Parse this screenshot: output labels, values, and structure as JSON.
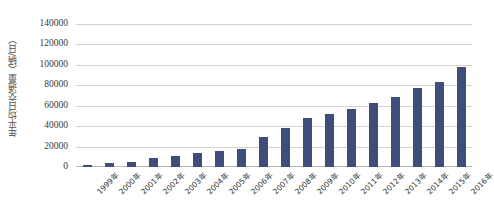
{
  "chart_data": {
    "type": "bar",
    "title": "",
    "subtitle": "",
    "xlabel": "",
    "ylabel": "年平均日交通量（辆/日）",
    "categories": [
      "1999年",
      "2000年",
      "2001年",
      "2002年",
      "2003年",
      "2004年",
      "2005年",
      "2006年",
      "2007年",
      "2008年",
      "2009年",
      "2010年",
      "2011年",
      "2012年",
      "2013年",
      "2014年",
      "2015年",
      "2016年"
    ],
    "values": [
      2000,
      3500,
      5000,
      8500,
      11000,
      13500,
      15500,
      18000,
      29000,
      38500,
      47500,
      51500,
      56500,
      63000,
      68500,
      77000,
      83500,
      97500
    ],
    "series": [
      {
        "name": "年平均日交通量",
        "values": [
          2000,
          3500,
          5000,
          8500,
          11000,
          13500,
          15500,
          18000,
          29000,
          38500,
          47500,
          51500,
          56500,
          63000,
          68500,
          77000,
          83500,
          97500
        ]
      }
    ],
    "ylim": [
      0,
      140000
    ],
    "ytick_values": [
      0,
      20000,
      40000,
      60000,
      80000,
      100000,
      120000,
      140000
    ],
    "ytick_labels": [
      "0",
      "20000",
      "40000",
      "60000",
      "80000",
      "100000",
      "120000",
      "140000"
    ],
    "grid": true,
    "grid_axis": "y",
    "legend": false,
    "legend_position": "none",
    "bar_color": "#3E4D79",
    "grid_color": "#D3D3D3",
    "background_color": "#FFFFFF",
    "axis_label_color": "#333333"
  }
}
